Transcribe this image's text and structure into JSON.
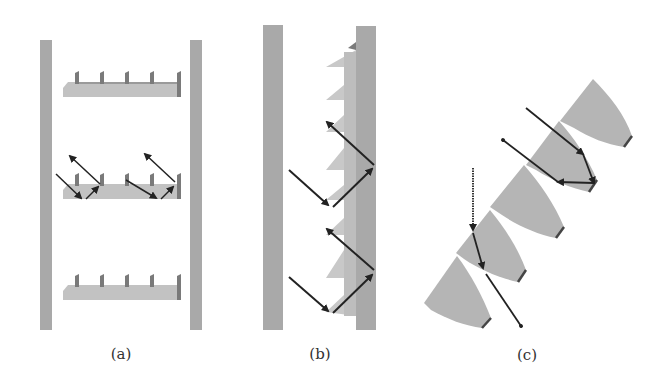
{
  "figure": {
    "panels": [
      {
        "id": "a",
        "label": "(a)",
        "description": "Two vertical walls with three horizontal sawtooth shelves between them; rays reflect off the middle shelf teeth"
      },
      {
        "id": "b",
        "label": "(b)",
        "description": "Two vertical walls; sawtooth prism structure attached to right wall; two rays bouncing between teeth and wall"
      },
      {
        "id": "c",
        "label": "(c)",
        "description": "Diagonal array of curved wedge-shaped elements; rays reflecting and refracting through wedges"
      }
    ],
    "colors": {
      "wall": "#a9a9a9",
      "structure": "#bdbdbd",
      "tooth_shadow": "#7a7a7a",
      "arrow": "#222222",
      "label": "#333333",
      "background": "#ffffff"
    }
  }
}
